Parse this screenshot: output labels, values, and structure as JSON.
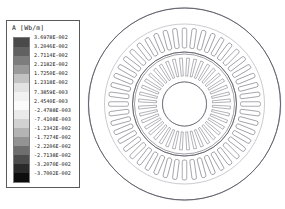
{
  "legend": {
    "title": "A [Wb/m]",
    "unit": "Wb/m",
    "quantity": "A",
    "colormap": "grayscale",
    "levels": [
      "3.6978E-002",
      "3.2046E-002",
      "2.7114E-002",
      "2.2182E-002",
      "1.7250E-002",
      "1.2318E-002",
      "7.3859E-003",
      "2.4540E-003",
      "-2.4788E-003",
      "-7.4108E-003",
      "-1.2342E-002",
      "-1.7274E-002",
      "-2.2206E-002",
      "-2.7138E-002",
      "-3.2070E-002",
      "-3.7002E-002"
    ],
    "band_colors": [
      "#4a4a4a",
      "#616161",
      "#7d7d7d",
      "#9a9a9a",
      "#c2c2c2",
      "#e2e2e2",
      "#f2f2f2",
      "#fbfbfb",
      "#eaeaea",
      "#d2d2d2",
      "#b4b4b4",
      "#939393",
      "#6e6e6e",
      "#4c4c4c",
      "#2a2a2a",
      "#0d0d0d"
    ]
  },
  "chart_data": {
    "type": "contour",
    "title": "A [Wb/m]",
    "colorbar_label": "A [Wb/m]",
    "vmin": "-3.7002E-002",
    "vmax": "3.6978E-002",
    "n_levels": 16,
    "geometry": {
      "outer_radius": 96,
      "stator_back_iron_inner_radius": 80,
      "stator_slot_outer_radius": 76,
      "stator_slot_inner_radius": 56,
      "airgap_radius": 52,
      "rotor_outer_radius": 50,
      "rotor_slot_outer_radius": 46,
      "rotor_slot_inner_radius": 28,
      "shaft_radius": 22,
      "stator_slots": 48,
      "rotor_slots": 40,
      "poles": 4
    },
    "line_color": "#8a8a95",
    "geometry_color": "#555560"
  },
  "plot": {
    "name": "machine-flux-plot"
  }
}
